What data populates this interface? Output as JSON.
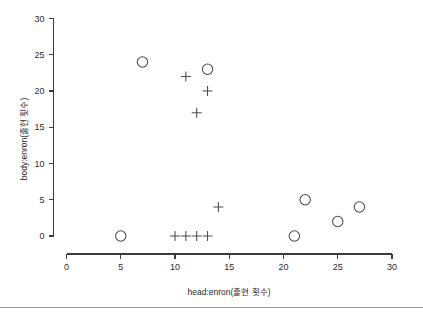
{
  "chart_data": {
    "type": "scatter",
    "title": "",
    "xlabel": "head:enron(출현 횟수)",
    "ylabel": "body:enron(출현 횟수)",
    "xlim": [
      0,
      30
    ],
    "ylim": [
      0,
      30
    ],
    "xticks": [
      0,
      5,
      10,
      15,
      20,
      25,
      30
    ],
    "yticks": [
      0,
      5,
      10,
      15,
      20,
      25,
      30
    ],
    "xtick_labels": [
      "0",
      "5",
      "10",
      "15",
      "20",
      "25",
      "30"
    ],
    "ytick_labels": [
      "0",
      "5",
      "10",
      "15",
      "20",
      "25",
      "30"
    ],
    "grid": false,
    "legend": "none",
    "series": [
      {
        "name": "circle-marker",
        "marker": "circle",
        "color": "#4a4a4a",
        "points": [
          {
            "x": 5,
            "y": 0
          },
          {
            "x": 7,
            "y": 24
          },
          {
            "x": 13,
            "y": 23
          },
          {
            "x": 21,
            "y": 0
          },
          {
            "x": 22,
            "y": 5
          },
          {
            "x": 25,
            "y": 2
          },
          {
            "x": 27,
            "y": 4
          }
        ]
      },
      {
        "name": "plus-marker",
        "marker": "plus",
        "color": "#4a4a4a",
        "points": [
          {
            "x": 10,
            "y": 0
          },
          {
            "x": 11,
            "y": 0
          },
          {
            "x": 12,
            "y": 0
          },
          {
            "x": 13,
            "y": 0
          },
          {
            "x": 11,
            "y": 22
          },
          {
            "x": 13,
            "y": 20
          },
          {
            "x": 12,
            "y": 17
          },
          {
            "x": 14,
            "y": 4
          }
        ]
      }
    ]
  },
  "figure": {
    "background_color": "#ffffff",
    "axis_color": "#3a3a3a",
    "marker_color": "#4a4a4a",
    "footer_rule_color": "#9a9a9a"
  }
}
